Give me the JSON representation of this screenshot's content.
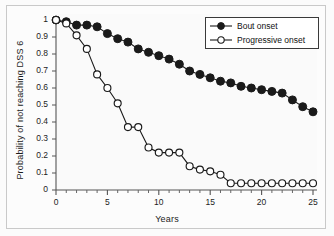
{
  "figure": {
    "background": "#fbfbfb",
    "frame_color": "#c9c9c9"
  },
  "axis": {
    "x_title": "Years",
    "y_title": "Probability of not reaching DSS 6",
    "x_ticks": [
      "0",
      "5",
      "10",
      "15",
      "20",
      "25"
    ],
    "y_ticks": [
      "0",
      "0.1",
      "0.2",
      "0.3",
      "0.4",
      "0.5",
      "0.6",
      "0.7",
      "0.8",
      "0.9",
      "1"
    ]
  },
  "legend": {
    "position": "top-right",
    "items": [
      {
        "label": "Bout onset",
        "marker": "filled-circle",
        "color": "#1a1a1a"
      },
      {
        "label": "Progressive onset",
        "marker": "open-circle",
        "color": "#1a1a1a"
      }
    ]
  },
  "chart_data": {
    "type": "line",
    "title": "",
    "subtitle": "",
    "xlabel": "Years",
    "ylabel": "Probability of not reaching DSS 6",
    "xlim": [
      0,
      25
    ],
    "ylim": [
      0,
      1
    ],
    "xticks": [
      0,
      5,
      10,
      15,
      20,
      25
    ],
    "xminor_tick_step": 1,
    "yticks": [
      0,
      0.1,
      0.2,
      0.3,
      0.4,
      0.5,
      0.6,
      0.7,
      0.8,
      0.9,
      1.0
    ],
    "grid": false,
    "legend_position": "top-right",
    "x": [
      0,
      1,
      2,
      3,
      4,
      5,
      6,
      7,
      8,
      9,
      10,
      11,
      12,
      13,
      14,
      15,
      16,
      17,
      18,
      19,
      20,
      21,
      22,
      23,
      24,
      25
    ],
    "series": [
      {
        "name": "Bout onset",
        "marker": "filled-circle",
        "color": "#1a1a1a",
        "values": [
          1.0,
          0.99,
          0.97,
          0.97,
          0.96,
          0.92,
          0.89,
          0.87,
          0.83,
          0.81,
          0.79,
          0.77,
          0.74,
          0.7,
          0.68,
          0.66,
          0.64,
          0.63,
          0.61,
          0.6,
          0.59,
          0.58,
          0.57,
          0.53,
          0.49,
          0.46
        ]
      },
      {
        "name": "Progressive onset",
        "marker": "open-circle",
        "color": "#1a1a1a",
        "values": [
          1.0,
          0.98,
          0.91,
          0.83,
          0.68,
          0.6,
          0.51,
          0.37,
          0.37,
          0.25,
          0.22,
          0.22,
          0.22,
          0.14,
          0.12,
          0.11,
          0.09,
          0.04,
          0.04,
          0.04,
          0.04,
          0.04,
          0.04,
          0.04,
          0.04,
          0.04
        ]
      }
    ]
  }
}
